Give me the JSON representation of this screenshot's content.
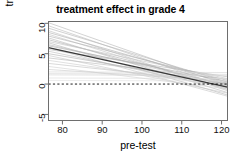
{
  "chart_data": {
    "type": "line",
    "title": "treatment effect in grade 4",
    "xlabel": "pre-test",
    "ylabel": "treatment effect",
    "xlim": [
      76.5,
      121.5
    ],
    "ylim": [
      -6.0,
      10.3
    ],
    "xticks": [
      80,
      90,
      100,
      110,
      120
    ],
    "yticks": [
      -5,
      0,
      5,
      10
    ],
    "grid": false,
    "legend": null,
    "annotations": [
      {
        "kind": "reference-line",
        "orientation": "horizontal",
        "y": 0,
        "style": "dashed",
        "color": "#000000"
      }
    ],
    "series": [
      {
        "name": "posterior draw 1",
        "style": "thin-gray",
        "color": "#b8b8b8",
        "x": [
          76.5,
          121.5
        ],
        "y": [
          10.1,
          -0.2
        ]
      },
      {
        "name": "posterior draw 2",
        "style": "thin-gray",
        "color": "#bcbcbc",
        "x": [
          76.5,
          121.5
        ],
        "y": [
          9.6,
          -0.6
        ]
      },
      {
        "name": "posterior draw 3",
        "style": "thin-gray",
        "color": "#b5b5b5",
        "x": [
          76.5,
          121.5
        ],
        "y": [
          9.2,
          0.3
        ]
      },
      {
        "name": "posterior draw 4",
        "style": "thin-gray",
        "color": "#c0c0c0",
        "x": [
          76.5,
          121.5
        ],
        "y": [
          8.8,
          -1.1
        ]
      },
      {
        "name": "posterior draw 5",
        "style": "thin-gray",
        "color": "#b0b0b0",
        "x": [
          76.5,
          121.5
        ],
        "y": [
          8.5,
          0.1
        ]
      },
      {
        "name": "posterior draw 6",
        "style": "thin-gray",
        "color": "#c4c4c4",
        "x": [
          76.5,
          121.5
        ],
        "y": [
          8.2,
          -0.9
        ]
      },
      {
        "name": "posterior draw 7",
        "style": "thin-gray",
        "color": "#b2b2b2",
        "x": [
          76.5,
          121.5
        ],
        "y": [
          7.9,
          0.6
        ]
      },
      {
        "name": "posterior draw 8",
        "style": "thin-gray",
        "color": "#bababa",
        "x": [
          76.5,
          121.5
        ],
        "y": [
          7.6,
          -1.4
        ]
      },
      {
        "name": "posterior draw 9",
        "style": "thin-gray",
        "color": "#aeaeae",
        "x": [
          76.5,
          121.5
        ],
        "y": [
          7.3,
          -0.3
        ]
      },
      {
        "name": "posterior draw 10",
        "style": "thin-gray",
        "color": "#c2c2c2",
        "x": [
          76.5,
          121.5
        ],
        "y": [
          7.0,
          0.9
        ]
      },
      {
        "name": "posterior draw 11",
        "style": "thin-gray",
        "color": "#b6b6b6",
        "x": [
          76.5,
          121.5
        ],
        "y": [
          6.8,
          -1.8
        ]
      },
      {
        "name": "posterior draw 12",
        "style": "thin-gray",
        "color": "#bdbdbd",
        "x": [
          76.5,
          121.5
        ],
        "y": [
          6.5,
          -0.1
        ]
      },
      {
        "name": "posterior draw 13",
        "style": "thin-gray",
        "color": "#aaaaaa",
        "x": [
          76.5,
          121.5
        ],
        "y": [
          6.3,
          0.4
        ]
      },
      {
        "name": "posterior draw 14",
        "style": "thin-gray",
        "color": "#c6c6c6",
        "x": [
          76.5,
          121.5
        ],
        "y": [
          6.0,
          -2.0
        ]
      },
      {
        "name": "posterior draw 15",
        "style": "thin-gray",
        "color": "#b4b4b4",
        "x": [
          76.5,
          121.5
        ],
        "y": [
          5.7,
          1.2
        ]
      },
      {
        "name": "posterior draw 16",
        "style": "thin-gray",
        "color": "#bebebe",
        "x": [
          76.5,
          121.5
        ],
        "y": [
          5.4,
          -0.7
        ]
      },
      {
        "name": "posterior draw 17",
        "style": "thin-gray",
        "color": "#b1b1b1",
        "x": [
          76.5,
          121.5
        ],
        "y": [
          5.0,
          0.0
        ]
      },
      {
        "name": "posterior draw 18",
        "style": "thin-gray",
        "color": "#c8c8c8",
        "x": [
          76.5,
          121.5
        ],
        "y": [
          4.7,
          -1.5
        ]
      },
      {
        "name": "posterior draw 19",
        "style": "thin-gray",
        "color": "#b9b9b9",
        "x": [
          76.5,
          121.5
        ],
        "y": [
          4.3,
          0.8
        ]
      },
      {
        "name": "posterior draw 20",
        "style": "thin-gray",
        "color": "#cccccc",
        "x": [
          76.5,
          121.5
        ],
        "y": [
          3.9,
          -0.4
        ]
      },
      {
        "name": "posterior draw 21",
        "style": "thin-gray",
        "color": "#c1c1c1",
        "x": [
          76.5,
          121.5
        ],
        "y": [
          3.4,
          0.2
        ]
      },
      {
        "name": "posterior draw 22",
        "style": "thin-gray",
        "color": "#d0d0d0",
        "x": [
          76.5,
          121.5
        ],
        "y": [
          2.9,
          -0.8
        ]
      },
      {
        "name": "posterior draw 23",
        "style": "thin-gray",
        "color": "#cacaca",
        "x": [
          76.5,
          121.5
        ],
        "y": [
          2.4,
          0.5
        ]
      },
      {
        "name": "posterior draw 24",
        "style": "thin-gray",
        "color": "#d4d4d4",
        "x": [
          76.5,
          121.5
        ],
        "y": [
          2.0,
          1.9
        ]
      },
      {
        "name": "posterior draw 25",
        "style": "thin-gray",
        "color": "#d2d2d2",
        "x": [
          76.5,
          121.5
        ],
        "y": [
          1.7,
          1.6
        ]
      },
      {
        "name": "posterior draw 26",
        "style": "thin-gray",
        "color": "#d8d8d8",
        "x": [
          76.5,
          121.5
        ],
        "y": [
          1.5,
          1.4
        ]
      },
      {
        "name": "posterior draw 27",
        "style": "thin-gray",
        "color": "#dcdcdc",
        "x": [
          76.5,
          121.5
        ],
        "y": [
          1.0,
          0.9
        ]
      },
      {
        "name": "posterior draw 28",
        "style": "thin-gray",
        "color": "#e0e0e0",
        "x": [
          76.5,
          121.5
        ],
        "y": [
          0.6,
          0.5
        ]
      },
      {
        "name": "posterior median",
        "style": "thick-dark",
        "color": "#3a3a3a",
        "x": [
          76.5,
          121.5
        ],
        "y": [
          6.0,
          -0.5
        ]
      }
    ]
  }
}
